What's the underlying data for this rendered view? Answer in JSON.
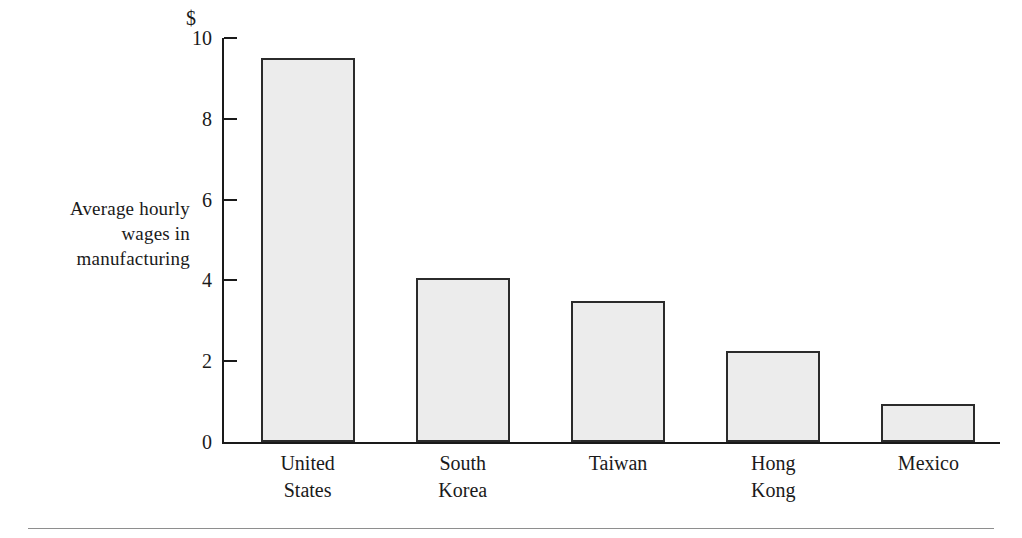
{
  "chart_data": {
    "type": "bar",
    "title": "",
    "subtitle": "",
    "xlabel": "",
    "ylabel": "Average hourly wages in manufacturing",
    "ylabel_lines": [
      "Average hourly",
      "wages in",
      "manufacturing"
    ],
    "currency_symbol": "$",
    "categories": [
      "United States",
      "South Korea",
      "Taiwan",
      "Hong Kong",
      "Mexico"
    ],
    "category_lines": [
      [
        "United",
        "States"
      ],
      [
        "South",
        "Korea"
      ],
      [
        "Taiwan"
      ],
      [
        "Hong",
        "Kong"
      ],
      [
        "Mexico"
      ]
    ],
    "values": [
      9.5,
      4.05,
      3.5,
      2.25,
      0.95
    ],
    "ylim": [
      0,
      10
    ],
    "yticks": [
      0,
      2,
      4,
      6,
      8,
      10
    ],
    "ytick_labels": [
      "0",
      "2",
      "4",
      "6",
      "8",
      "10"
    ],
    "grid": false,
    "legend": false,
    "bar_fill_color": "#ececec",
    "bar_edge_color": "#2b2b2b",
    "axis_color": "#1a1a1a",
    "background_color": "#ffffff"
  }
}
